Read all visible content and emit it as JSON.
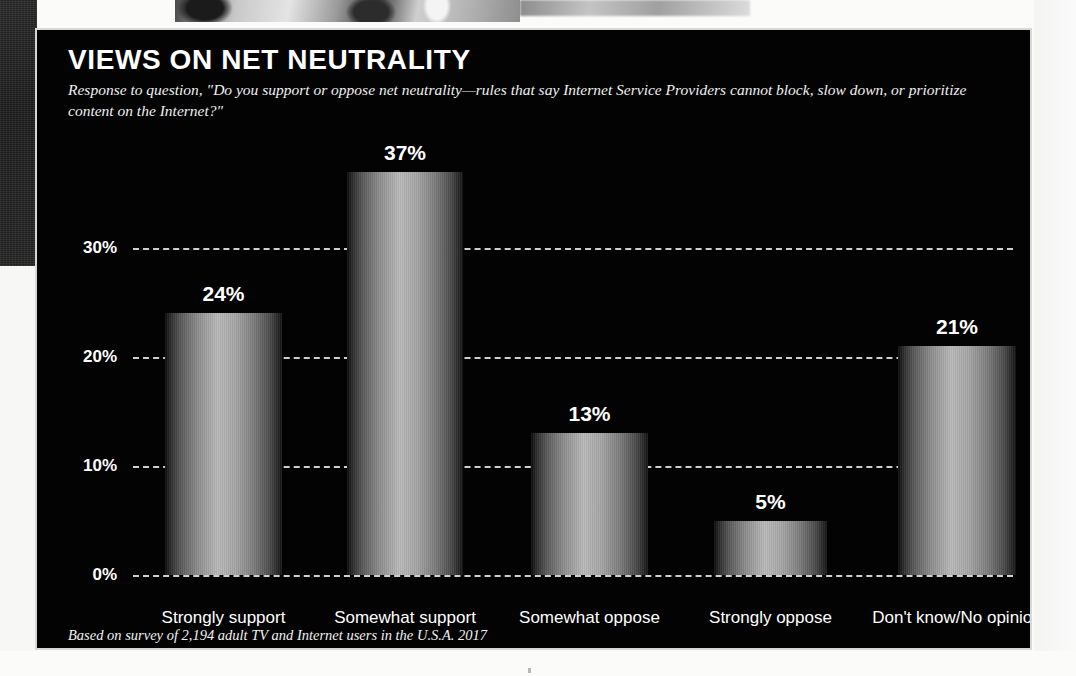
{
  "panel": {
    "title": "VIEWS ON NET NEUTRALITY",
    "subtitle": "Response to question, \"Do you support or oppose net neutrality—rules that say Internet Service Providers cannot block, slow down, or prioritize content on the Internet?\"",
    "footnote": "Based on survey of 2,194 adult TV and Internet users in the U.S.A. 2017",
    "background_color": "#030303",
    "border_color": "#d8d8d8",
    "text_color": "#ffffff"
  },
  "chart_data": {
    "type": "bar",
    "title": "VIEWS ON NET NEUTRALITY",
    "subtitle": "Response to question, \"Do you support or oppose net neutrality—rules that say Internet Service Providers cannot block, slow down, or prioritize content on the Internet?\"",
    "xlabel": "",
    "ylabel": "",
    "categories": [
      "Strongly support",
      "Somewhat support",
      "Somewhat oppose",
      "Strongly oppose",
      "Don't know/No opinion"
    ],
    "values": [
      24,
      37,
      13,
      5,
      21
    ],
    "value_labels": [
      "24%",
      "37%",
      "13%",
      "5%",
      "21%"
    ],
    "ylim": [
      0,
      40
    ],
    "yticks": [
      0,
      10,
      20,
      30
    ],
    "ytick_labels": [
      "0%",
      "10%",
      "20%",
      "30%"
    ],
    "grid": true,
    "grid_style": "dashed",
    "grid_color": "#cfcfcf",
    "legend": "none",
    "bar_style": "cylinder-gradient-grayscale",
    "source_note": "Based on survey of 2,194 adult TV and Internet users in the U.S.A. 2017"
  }
}
